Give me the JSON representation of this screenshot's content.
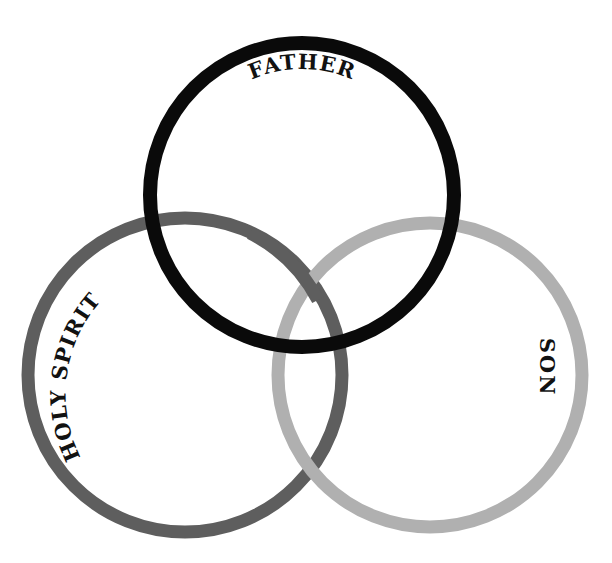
{
  "diagram": {
    "title": "",
    "circles": [
      {
        "name": "father",
        "label": "FATHER",
        "color": "#0a0a0a",
        "cx": 302,
        "cy": 195,
        "r": 152,
        "stroke": 14
      },
      {
        "name": "holy-spirit",
        "label": "HOLY SPIRIT",
        "color": "#5e5e5e",
        "cx": 185,
        "cy": 375,
        "r": 157,
        "stroke": 13
      },
      {
        "name": "son",
        "label": "SON",
        "color": "#b0b0b0",
        "cx": 430,
        "cy": 375,
        "r": 152,
        "stroke": 13
      }
    ],
    "labels": {
      "father": "FATHER",
      "holy_spirit": "HOLY SPIRIT",
      "son": "SON"
    }
  }
}
